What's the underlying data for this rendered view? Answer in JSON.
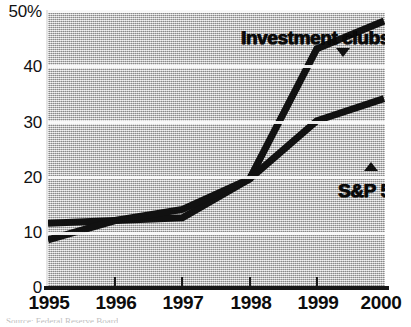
{
  "chart_data": {
    "type": "line",
    "title": "",
    "subtitle": "",
    "xlabel": "",
    "ylabel": "",
    "x": [
      "1995",
      "1996",
      "1997",
      "1998",
      "1999",
      "2000"
    ],
    "categories": [
      "1995",
      "1996",
      "1997",
      "1998",
      "1999",
      "2000"
    ],
    "xlim": [
      1995,
      2000
    ],
    "ylim": [
      0,
      50
    ],
    "y_ticks": [
      0,
      10,
      20,
      30,
      40,
      50
    ],
    "y_tick_labels": [
      "0",
      "10",
      "20",
      "30",
      "40",
      "50%"
    ],
    "x_tick_labels": [
      "1995",
      "1996",
      "1997",
      "1998",
      "1999",
      "2000"
    ],
    "grid": "horizontal",
    "legend_position": "inline-annotations",
    "plot_background": "#bdbdbd",
    "series": [
      {
        "name": "Investment clubs",
        "color": "#111111",
        "marker": "triangle-down",
        "values": [
          11.5,
          12.0,
          12.5,
          19.5,
          43.0,
          48.0
        ]
      },
      {
        "name": "S&P 500",
        "color": "#111111",
        "marker": "triangle-up",
        "values": [
          8.5,
          12.0,
          14.0,
          19.5,
          30.0,
          34.0
        ]
      }
    ],
    "annotations": [
      {
        "text": "Investment clubs",
        "series": "Investment clubs",
        "marker": "triangle-down"
      },
      {
        "text": "S&P 500",
        "series": "S&P 500",
        "marker": "triangle-up"
      }
    ]
  },
  "labels": {
    "investment_clubs": "Investment clubs",
    "sp500": "S&P 500"
  },
  "axis": {
    "y_labels": [
      "50%",
      "40",
      "30",
      "20",
      "10",
      "0"
    ],
    "x_labels": [
      "1995",
      "1996",
      "1997",
      "1998",
      "1999",
      "2000"
    ]
  },
  "footer": {
    "source_note": "Source: Federal Reserve Board"
  }
}
